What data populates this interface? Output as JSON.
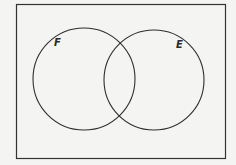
{
  "diagram": {
    "type": "venn",
    "universe": {
      "x": 16,
      "y": 4,
      "width": 210,
      "height": 154,
      "stroke": "#333333"
    },
    "sets": [
      {
        "label": "F",
        "cx": 84,
        "cy": 79,
        "r": 51,
        "label_x": 54,
        "label_y": 46
      },
      {
        "label": "E",
        "cx": 154,
        "cy": 80,
        "r": 50,
        "label_x": 176,
        "label_y": 48
      }
    ],
    "background": "#f4f4f2",
    "stroke_color": "#2e2e2e"
  }
}
